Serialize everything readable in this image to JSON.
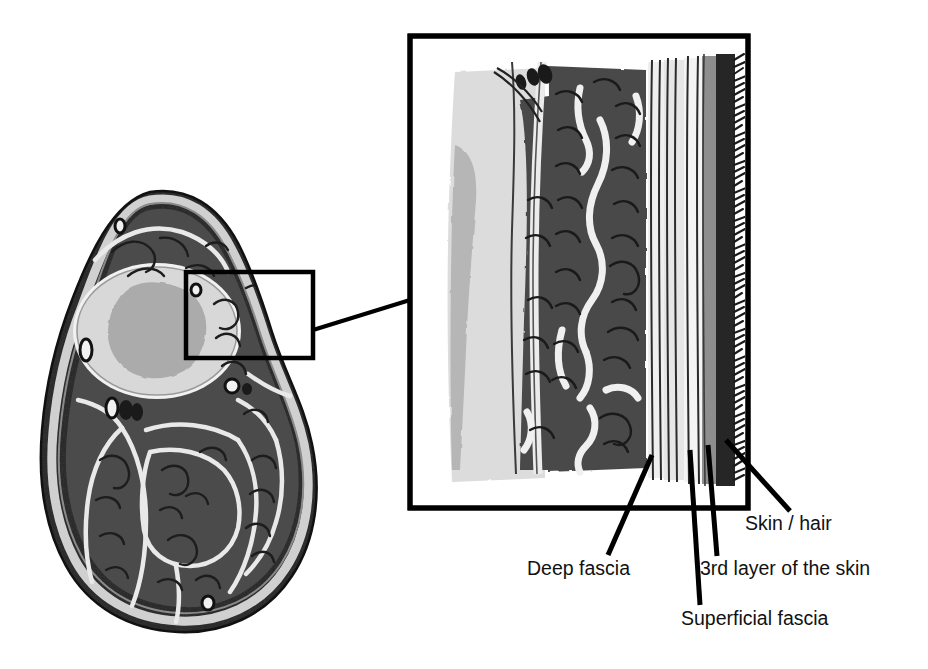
{
  "figure": {
    "type": "anatomical-cross-section-diagram",
    "background_color": "#ffffff"
  },
  "cross_section": {
    "name": "limb-cross-section",
    "description": "Transverse cross-section of a limb showing bone, marrow, muscle compartments, fascial septa and skin rim",
    "structures": [
      {
        "id": "bone-cortex",
        "label": "Bone",
        "color": "#d8d8d8"
      },
      {
        "id": "bone-marrow",
        "label": "Marrow",
        "color": "#ababab"
      },
      {
        "id": "muscle",
        "label": "Muscle",
        "color": "#4a4a4a"
      },
      {
        "id": "fascial-septa",
        "label": "Fascial septa",
        "color": "#e8e8e8"
      },
      {
        "id": "skin-rim",
        "label": "Skin",
        "color": "#2e2e2e"
      },
      {
        "id": "vessels",
        "label": "Vessels",
        "color": "#1a1a1a"
      }
    ]
  },
  "roi_box": {
    "name": "region-of-interest-box",
    "x": 186,
    "y": 272,
    "width": 127,
    "height": 86,
    "stroke_color": "#000000",
    "stroke_width": 4
  },
  "connector": {
    "name": "roi-to-inset-connector",
    "stroke_color": "#000000",
    "stroke_width": 4
  },
  "inset": {
    "name": "magnified-inset",
    "x": 410,
    "y": 36,
    "width": 338,
    "height": 472,
    "stroke_color": "#000000",
    "stroke_width": 5,
    "description": "Magnified view of the skin and fascia layers, from bone (left) to hair (right)",
    "layers": [
      {
        "id": "bone",
        "label": "Bone",
        "color": "#d8d8d8"
      },
      {
        "id": "marrow-shadow",
        "label": "Marrow shadow",
        "color": "#b4b4b4"
      },
      {
        "id": "muscle",
        "label": "Muscle",
        "color": "#4a4a4a"
      },
      {
        "id": "deep-fascia",
        "label": "Deep fascia",
        "color": "#e6e6e6"
      },
      {
        "id": "superficial-fascia",
        "label": "Superficial fascia",
        "color": "#efefef"
      },
      {
        "id": "third-layer",
        "label": "3rd layer of the skin",
        "color": "#8c8c8c"
      },
      {
        "id": "skin",
        "label": "Skin / hair",
        "color": "#2a2a2a"
      }
    ]
  },
  "labels": {
    "skin_hair": "Skin / hair",
    "deep_fascia": "Deep fascia",
    "third_layer": "3rd layer of the skin",
    "superficial_fascia": "Superficial fascia"
  },
  "leader_lines": {
    "name": "leader-lines",
    "stroke_color": "#000000",
    "stroke_width": 5,
    "count": 4
  }
}
